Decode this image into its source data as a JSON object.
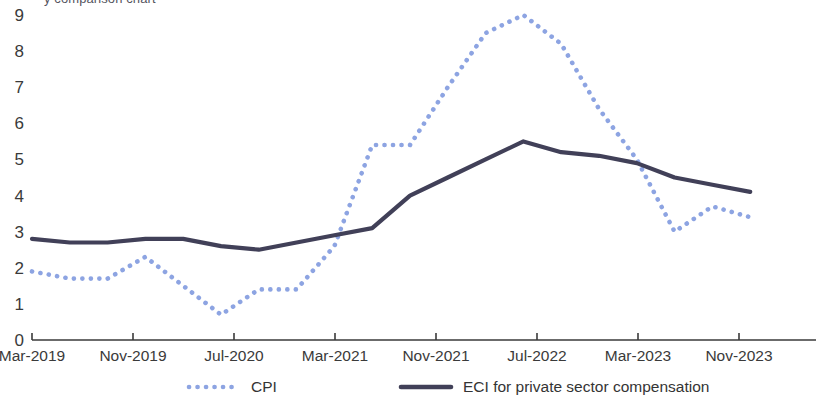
{
  "title_partial": "y comparison chart",
  "axes": {
    "y_ticks": [
      "9",
      "8",
      "7",
      "6",
      "5",
      "4",
      "3",
      "2",
      "1",
      "0"
    ],
    "x_ticks": [
      "Mar-2019",
      "Nov-2019",
      "Jul-2020",
      "Mar-2021",
      "Nov-2021",
      "Jul-2022",
      "Mar-2023",
      "Nov-2023"
    ],
    "ylabel": "",
    "xlabel": ""
  },
  "legend": {
    "items": [
      {
        "label": "CPI",
        "color": "#8da4e2",
        "style": "dotted"
      },
      {
        "label": "ECI for private sector compensation",
        "color": "#414058",
        "style": "solid"
      }
    ]
  },
  "colors": {
    "cpi": "#8da4e2",
    "eci": "#414058",
    "axis": "#3a3a3a",
    "text": "#3a3a3a"
  },
  "chart_data": {
    "type": "line",
    "title": "",
    "xlabel": "",
    "ylabel": "",
    "ylim": [
      0,
      9
    ],
    "grid": false,
    "legend_position": "bottom",
    "x_tick_labels": [
      "Mar-2019",
      "Nov-2019",
      "Jul-2020",
      "Mar-2021",
      "Nov-2021",
      "Jul-2022",
      "Mar-2023",
      "Nov-2023"
    ],
    "x": [
      "Mar-2019",
      "Jun-2019",
      "Sep-2019",
      "Dec-2019",
      "Mar-2020",
      "Jun-2020",
      "Sep-2020",
      "Dec-2020",
      "Mar-2021",
      "Jun-2021",
      "Sep-2021",
      "Dec-2021",
      "Mar-2022",
      "Jun-2022",
      "Sep-2022",
      "Dec-2022",
      "Mar-2023",
      "Jun-2023",
      "Sep-2023",
      "Dec-2023"
    ],
    "series": [
      {
        "name": "CPI",
        "style": "dotted",
        "color": "#8da4e2",
        "values": [
          1.9,
          1.7,
          1.7,
          2.3,
          1.5,
          0.7,
          1.4,
          1.4,
          2.6,
          5.4,
          5.4,
          7.0,
          8.5,
          9.0,
          8.2,
          6.4,
          5.0,
          3.0,
          3.7,
          3.4
        ]
      },
      {
        "name": "ECI for private sector compensation",
        "style": "solid",
        "color": "#414058",
        "values": [
          2.8,
          2.7,
          2.7,
          2.8,
          2.8,
          2.6,
          2.5,
          2.7,
          2.9,
          3.1,
          4.0,
          4.5,
          5.0,
          5.5,
          5.2,
          5.1,
          4.9,
          4.5,
          4.3,
          4.1
        ]
      }
    ]
  },
  "geometry": {
    "plot_left": 32,
    "plot_right": 816,
    "plot_top": 15,
    "plot_bottom": 340,
    "first_tick_x": 32,
    "tick_spacing_px": 101,
    "point_spacing_px": 37.8
  }
}
